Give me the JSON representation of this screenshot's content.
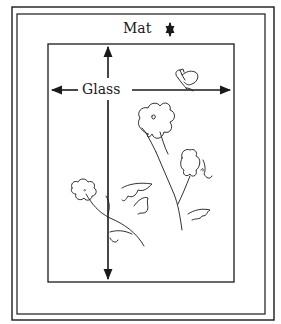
{
  "diagram": {
    "labels": {
      "mat": "Mat",
      "glass": "Glass"
    },
    "colors": {
      "ink": "#1a1a1a",
      "background": "#ffffff"
    },
    "components": [
      {
        "name": "outer-frame",
        "shape": "rectangle"
      },
      {
        "name": "inner-frame",
        "shape": "rectangle"
      },
      {
        "name": "glass-panel",
        "shape": "rectangle"
      },
      {
        "name": "mat-width-arrow",
        "shape": "double-arrow",
        "orientation": "vertical"
      },
      {
        "name": "glass-width-arrow",
        "shape": "double-arrow",
        "orientation": "horizontal"
      },
      {
        "name": "glass-height-arrow",
        "shape": "double-arrow",
        "orientation": "vertical"
      },
      {
        "name": "flower-illustration",
        "shape": "line-drawing"
      },
      {
        "name": "butterfly-illustration",
        "shape": "line-drawing"
      }
    ]
  }
}
